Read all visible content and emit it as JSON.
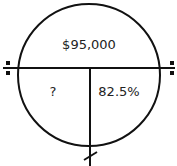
{
  "diagram": {
    "type": "percent-magic-circle",
    "top_section": {
      "label": "$95,000",
      "role": "whole"
    },
    "bottom_left_section": {
      "label": "?",
      "role": "part"
    },
    "bottom_right_section": {
      "label": "82.5%",
      "role": "percent"
    },
    "symbols": {
      "left": "divide-icon",
      "right": "divide-icon",
      "bottom": "multiply-slash-icon"
    },
    "stroke_color": "#111111",
    "text_color": "#222222"
  }
}
